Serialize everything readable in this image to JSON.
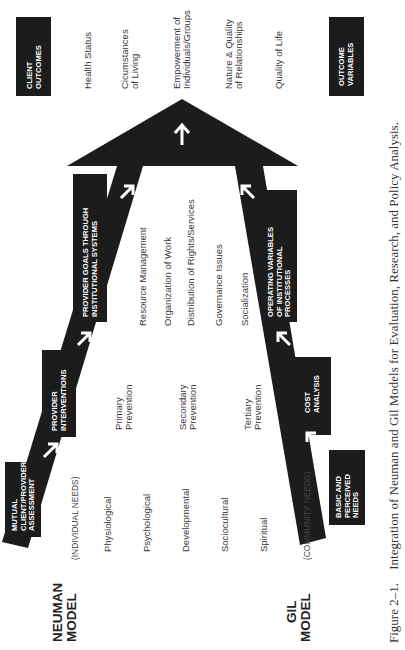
{
  "neuman_model": {
    "label_line1": "NEUMAN",
    "label_line2": "MODEL",
    "needs_label": "(INDIVIDUAL NEEDS)",
    "stages": [
      {
        "lines": [
          "MUTUAL",
          "CLIENT/PROVIDER",
          "ASSESSMENT"
        ]
      },
      {
        "lines": [
          "PROVIDER",
          "INTERVENTIONS"
        ]
      },
      {
        "lines": [
          "PROVIDER GOALS THROUGH",
          "INSTITUTIONAL SYSTEMS"
        ]
      }
    ],
    "variables": [
      "Physiological",
      "Psychological",
      "Developmental",
      "Sociocultural",
      "Spiritual"
    ],
    "prevention": [
      {
        "lines": [
          "Primary",
          "Prevention"
        ]
      },
      {
        "lines": [
          "Secondary",
          "Prevention"
        ]
      },
      {
        "lines": [
          "Tertiary",
          "Prevention"
        ]
      }
    ]
  },
  "gil_model": {
    "label_line1": "GIL",
    "label_line2": "MODEL",
    "needs_label": "(COMMUNITY NEEDS)",
    "stages": [
      {
        "lines": [
          "BASIC AND",
          "PERCEIVED",
          "NEEDS"
        ]
      },
      {
        "lines": [
          "COST",
          "ANALYSIS"
        ]
      },
      {
        "lines": [
          "OPERATING VARIABLES",
          "OF INSTITUTIONAL",
          "PROCESSES"
        ]
      }
    ]
  },
  "institutional_processes": [
    "Resource Management",
    "Organization of Work",
    "Distribution of Rights/Services",
    "Governance Issues",
    "Socialization"
  ],
  "client_outcomes": {
    "header_lines": [
      "CLIENT",
      "OUTCOMES"
    ],
    "items": [
      {
        "lines": [
          "Health Status"
        ]
      },
      {
        "lines": [
          "Cicumstances",
          "of Living"
        ]
      },
      {
        "lines": [
          "Empowerment of",
          "Individuals/Groups"
        ]
      },
      {
        "lines": [
          "Nature & Quality",
          "of Relationships"
        ]
      },
      {
        "lines": [
          "Quality of Life"
        ]
      }
    ]
  },
  "outcome_variables": {
    "header_lines": [
      "OUTCOME",
      "VARIABLES"
    ]
  },
  "caption": {
    "number": "Figure 2–1.",
    "text": "Integration of Neuman and Gil Models for Evaluation, Research, and Policy Analysis."
  },
  "colors": {
    "shape_fill": "#1c1c1c",
    "text": "#3a3a3a",
    "background": "#ffffff"
  }
}
